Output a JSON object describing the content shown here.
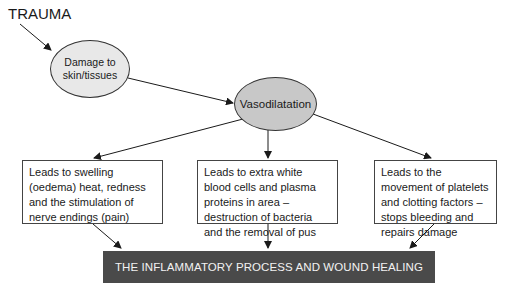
{
  "diagram": {
    "start_label": "TRAUMA",
    "nodes": {
      "damage": "Damage to skin/tissues",
      "damage_lines": [
        "Damage to",
        "skin/tissues"
      ],
      "vasodilatation": "Vasodilatation"
    },
    "effects": [
      {
        "id": "swelling",
        "text": "Leads to swelling (oedema) heat, redness and the stimulation of nerve endings (pain)"
      },
      {
        "id": "white-blood-cells",
        "text": "Leads to extra white blood cells and plasma proteins in area – destruction of bacteria and the removal of pus"
      },
      {
        "id": "platelets",
        "text": "Leads to the movement of platelets and clotting factors – stops bleeding and repairs damage"
      }
    ],
    "outcome": "THE INFLAMMATORY PROCESS AND WOUND HEALING",
    "colors": {
      "damage_fill": "#e8e8e8",
      "vasodilatation_fill": "#c8c8c8",
      "outcome_fill": "#4a4a4a",
      "outcome_text": "#f2f2f2",
      "line": "#1a1a1a"
    }
  }
}
